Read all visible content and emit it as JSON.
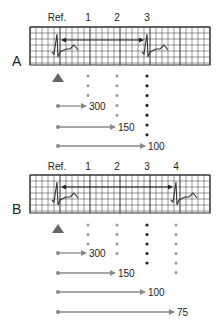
{
  "colors": {
    "grid": "#333333",
    "trace": "#333333",
    "arrow_gray": "#8a8a8a",
    "dot_gray": "#9a9a9a",
    "dot_dark": "#222222",
    "triangle": "#666666"
  },
  "panels": [
    {
      "id": "A",
      "label": "A",
      "column_labels": [
        "Ref.",
        "1",
        "2",
        "3"
      ],
      "rr_interval_ends_at_column": 3,
      "highlight_column": 3,
      "dot_counts": [
        3,
        5,
        7
      ],
      "rate_arrows": [
        {
          "value": "300",
          "to_column": 1
        },
        {
          "value": "150",
          "to_column": 2
        },
        {
          "value": "100",
          "to_column": 3
        }
      ]
    },
    {
      "id": "B",
      "label": "B",
      "column_labels": [
        "Ref.",
        "1",
        "2",
        "3",
        "4"
      ],
      "rr_interval_ends_at_column": 4,
      "highlight_column": 3,
      "dot_counts": [
        3,
        4,
        5,
        6
      ],
      "rate_arrows": [
        {
          "value": "300",
          "to_column": 1
        },
        {
          "value": "150",
          "to_column": 2
        },
        {
          "value": "100",
          "to_column": 3
        },
        {
          "value": "75",
          "to_column": 4
        }
      ]
    }
  ]
}
